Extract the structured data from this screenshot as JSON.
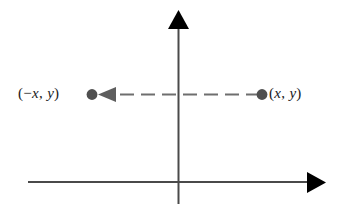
{
  "figure": {
    "background_color": "#ffffff",
    "width": 337,
    "height": 204,
    "axis_color": "#4a4a4a",
    "arrow_color": "#000000",
    "connector_color": "#6e6e6e",
    "point_color": "#4f4f4f"
  },
  "labels": {
    "reflected_point": "(−x, y)",
    "original_point": "(x, y)"
  },
  "chart_data": {
    "type": "scatter",
    "title": "",
    "xlabel": "",
    "ylabel": "",
    "grid": false,
    "legend": null,
    "axes": {
      "origin_px": [
        178,
        182
      ],
      "x_axis": {
        "from_px": [
          28,
          182
        ],
        "to_px": [
          326,
          182
        ],
        "arrow": "right",
        "ticks": [],
        "tick_labels": []
      },
      "y_axis": {
        "from_px": [
          178,
          204
        ],
        "to_px": [
          178,
          10
        ],
        "arrow": "up",
        "ticks": [],
        "tick_labels": []
      }
    },
    "points": [
      {
        "name": "original_point",
        "label": "(x, y)",
        "px": [
          262,
          94
        ],
        "label_position": "right",
        "color": "#4f4f4f"
      },
      {
        "name": "reflected_point",
        "label": "(−x, y)",
        "px": [
          92,
          94
        ],
        "label_position": "left",
        "color": "#4f4f4f"
      }
    ],
    "annotations": [
      {
        "name": "reflection-arrow",
        "type": "arrow",
        "style": "dashed",
        "from_px": [
          262,
          94
        ],
        "to_px": [
          98,
          94
        ],
        "arrowhead": "left",
        "color": "#6e6e6e",
        "dash": [
          14,
          7
        ]
      }
    ]
  }
}
